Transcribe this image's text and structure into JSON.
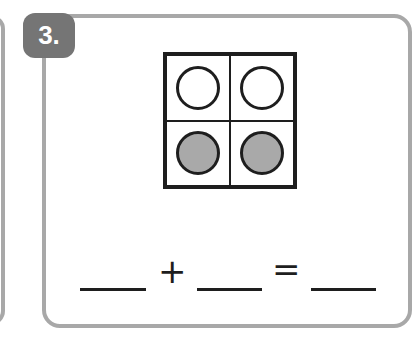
{
  "problem": {
    "number_label": "3.",
    "ten_frame": {
      "rows": 2,
      "cols": 2,
      "cells": [
        "empty",
        "empty",
        "filled",
        "filled"
      ]
    },
    "equation": {
      "blank1": "",
      "operator_plus": "+",
      "blank2": "",
      "operator_equals": "=",
      "blank3": ""
    }
  },
  "colors": {
    "border": "#a8a8a8",
    "badge": "#757575",
    "filled_circle": "#a9a9a9",
    "ink": "#1e1e1e"
  }
}
